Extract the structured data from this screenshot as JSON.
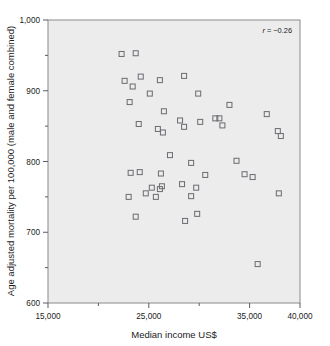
{
  "chart_data": {
    "type": "scatter",
    "title": "",
    "xlabel": "Median income US$",
    "ylabel": "Age adjusted mortality per 100,000 (male and female combined)",
    "xlim": [
      15000,
      40000
    ],
    "ylim": [
      600,
      1000
    ],
    "grid": false,
    "legend": null,
    "annotations": [
      {
        "name": "correlation",
        "text_italic": "r",
        "text": " = −0.26",
        "full": "r = −0.26",
        "x_frac": 0.93,
        "y_frac": 0.96
      }
    ],
    "xticks": [
      15000,
      25000,
      35000,
      40000
    ],
    "xtick_labels": [
      "15,000",
      "25,000",
      "35,000",
      "40,000"
    ],
    "xticks_minor": [
      20000,
      30000
    ],
    "yticks": [
      600,
      700,
      800,
      900,
      1000
    ],
    "ytick_labels": [
      "600",
      "700",
      "800",
      "900",
      "1,000"
    ],
    "yticks_minor": [
      650,
      750,
      850,
      950
    ],
    "marker": "open-square",
    "marker_color": "#6b6b70",
    "plot_background": "#ececed",
    "points": [
      {
        "x": 22300,
        "y": 952
      },
      {
        "x": 23700,
        "y": 953
      },
      {
        "x": 22600,
        "y": 914
      },
      {
        "x": 23400,
        "y": 906
      },
      {
        "x": 24200,
        "y": 920
      },
      {
        "x": 26100,
        "y": 915
      },
      {
        "x": 28500,
        "y": 921
      },
      {
        "x": 23100,
        "y": 884
      },
      {
        "x": 25100,
        "y": 896
      },
      {
        "x": 29900,
        "y": 896
      },
      {
        "x": 33000,
        "y": 880
      },
      {
        "x": 26500,
        "y": 871
      },
      {
        "x": 36700,
        "y": 867
      },
      {
        "x": 24000,
        "y": 853
      },
      {
        "x": 28100,
        "y": 858
      },
      {
        "x": 30100,
        "y": 856
      },
      {
        "x": 31600,
        "y": 861
      },
      {
        "x": 32000,
        "y": 861
      },
      {
        "x": 28500,
        "y": 849
      },
      {
        "x": 32300,
        "y": 851
      },
      {
        "x": 25900,
        "y": 846
      },
      {
        "x": 26400,
        "y": 841
      },
      {
        "x": 37800,
        "y": 843
      },
      {
        "x": 38100,
        "y": 836
      },
      {
        "x": 27100,
        "y": 809
      },
      {
        "x": 29200,
        "y": 798
      },
      {
        "x": 33700,
        "y": 801
      },
      {
        "x": 23200,
        "y": 784
      },
      {
        "x": 24100,
        "y": 785
      },
      {
        "x": 26200,
        "y": 783
      },
      {
        "x": 30600,
        "y": 781
      },
      {
        "x": 34500,
        "y": 782
      },
      {
        "x": 35300,
        "y": 778
      },
      {
        "x": 25300,
        "y": 763
      },
      {
        "x": 26100,
        "y": 761
      },
      {
        "x": 26300,
        "y": 765
      },
      {
        "x": 28300,
        "y": 768
      },
      {
        "x": 29700,
        "y": 763
      },
      {
        "x": 24700,
        "y": 755
      },
      {
        "x": 23000,
        "y": 750
      },
      {
        "x": 25700,
        "y": 750
      },
      {
        "x": 29200,
        "y": 751
      },
      {
        "x": 37900,
        "y": 755
      },
      {
        "x": 23700,
        "y": 722
      },
      {
        "x": 28600,
        "y": 716
      },
      {
        "x": 29800,
        "y": 726
      },
      {
        "x": 35800,
        "y": 655
      }
    ],
    "n_points": 47
  },
  "figure": {
    "plot_area": {
      "left": 48,
      "top": 20,
      "right": 300,
      "bottom": 303
    }
  }
}
